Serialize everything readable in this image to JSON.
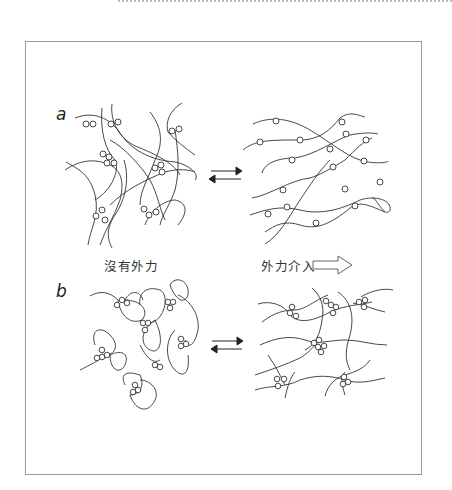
{
  "figure": {
    "panels": [
      {
        "label": "a",
        "left_caption": "沒有外力",
        "right_caption": "外力介入"
      },
      {
        "label": "b"
      }
    ],
    "line_color": "#333333",
    "frame_color": "#9a9a9a",
    "arrow": {
      "type": "equilibrium",
      "forward": "right",
      "reverse": "left"
    },
    "hollow_arrow": "right"
  }
}
